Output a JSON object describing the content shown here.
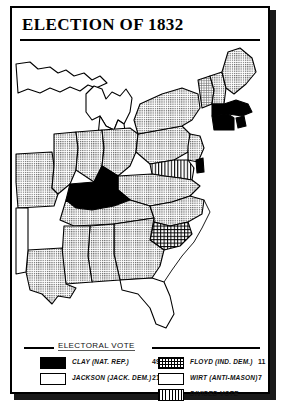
{
  "title": "ELECTION OF 1832",
  "legend": {
    "heading": "ELECTORAL VOTE",
    "left_entries": [
      {
        "pattern": "clay",
        "label": "CLAY (NAT. REP.)",
        "votes": "49"
      },
      {
        "pattern": "jackson",
        "label": "JACKSON (JACK. DEM.)",
        "votes": "219"
      }
    ],
    "right_entries": [
      {
        "pattern": "floyd",
        "label": "FLOYD (IND. DEM.)",
        "votes": "11"
      },
      {
        "pattern": "wirt",
        "label": "WIRT (ANTI-MASON)",
        "votes": "7"
      },
      {
        "pattern": "divided",
        "label": "DIVIDED VOTE",
        "votes": ""
      }
    ]
  },
  "colors": {
    "clay": "#000000",
    "jackson": "#cfcfcf",
    "floyd": "#b4b4b4",
    "wirt": "#d8d8d8",
    "divided": "#ffffff",
    "unshaded": "#ffffff",
    "outline": "#000000"
  },
  "map": {
    "region": "Eastern United States, 1832",
    "states": [
      {
        "name": "Maine",
        "candidate": "JACKSON"
      },
      {
        "name": "New Hampshire",
        "candidate": "JACKSON"
      },
      {
        "name": "Vermont",
        "candidate": "WIRT"
      },
      {
        "name": "Massachusetts",
        "candidate": "CLAY"
      },
      {
        "name": "Rhode Island",
        "candidate": "CLAY"
      },
      {
        "name": "Connecticut",
        "candidate": "CLAY"
      },
      {
        "name": "New York",
        "candidate": "JACKSON"
      },
      {
        "name": "Pennsylvania",
        "candidate": "JACKSON"
      },
      {
        "name": "New Jersey",
        "candidate": "JACKSON"
      },
      {
        "name": "Delaware",
        "candidate": "CLAY"
      },
      {
        "name": "Maryland",
        "candidate": "DIVIDED"
      },
      {
        "name": "Virginia",
        "candidate": "JACKSON"
      },
      {
        "name": "North Carolina",
        "candidate": "JACKSON"
      },
      {
        "name": "South Carolina",
        "candidate": "FLOYD"
      },
      {
        "name": "Georgia",
        "candidate": "JACKSON"
      },
      {
        "name": "Alabama",
        "candidate": "JACKSON"
      },
      {
        "name": "Mississippi",
        "candidate": "JACKSON"
      },
      {
        "name": "Louisiana",
        "candidate": "JACKSON"
      },
      {
        "name": "Tennessee",
        "candidate": "JACKSON"
      },
      {
        "name": "Kentucky",
        "candidate": "CLAY"
      },
      {
        "name": "Ohio",
        "candidate": "JACKSON"
      },
      {
        "name": "Indiana",
        "candidate": "JACKSON"
      },
      {
        "name": "Illinois",
        "candidate": "JACKSON"
      },
      {
        "name": "Missouri",
        "candidate": "JACKSON"
      },
      {
        "name": "Michigan Territory",
        "candidate": "NONE"
      },
      {
        "name": "Florida Territory",
        "candidate": "NONE"
      }
    ]
  }
}
